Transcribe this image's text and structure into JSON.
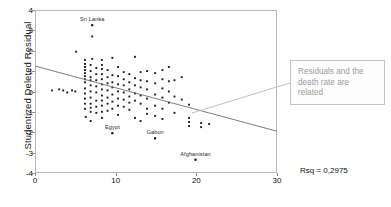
{
  "chart_data": {
    "type": "scatter",
    "title": "",
    "xlabel": "",
    "ylabel": "Studentized Deleted Residual",
    "xlim": [
      0,
      30
    ],
    "ylim": [
      -4,
      4
    ],
    "xticks": [
      "0",
      "10",
      "20",
      "30"
    ],
    "xtick_values": [
      0,
      10,
      20,
      30
    ],
    "yticks": [
      "4",
      "3",
      "2",
      "1",
      "0",
      "-1",
      "-2",
      "-3",
      "-4"
    ],
    "ytick_values": [
      4,
      3,
      2,
      1,
      0,
      -1,
      -2,
      -3,
      -4
    ],
    "grid": false,
    "legend": "none",
    "annotations": [
      {
        "text": "Rsq = 0.2975",
        "kind": "statistic"
      }
    ],
    "fit_line": {
      "name": "linear regression",
      "x": [
        0,
        30
      ],
      "y": [
        1.25,
        -1.95
      ],
      "rsq": 0.2975
    },
    "point_labels": [
      {
        "label": "Sri Lanka",
        "x": 7.1,
        "y": 3.25
      },
      {
        "label": "Egypt",
        "x": 9.6,
        "y": -2.05
      },
      {
        "label": "Gabon",
        "x": 14.9,
        "y": -2.3
      },
      {
        "label": "Afghanistan",
        "x": 19.9,
        "y": -3.35
      }
    ],
    "points": [
      [
        2.1,
        0.05
      ],
      [
        3.5,
        0.05
      ],
      [
        4.6,
        0.05
      ],
      [
        5.1,
        1.95
      ],
      [
        6.2,
        1.55
      ],
      [
        6.2,
        1.35
      ],
      [
        6.2,
        1.2
      ],
      [
        6.2,
        1.05
      ],
      [
        6.2,
        0.9
      ],
      [
        6.2,
        0.75
      ],
      [
        6.2,
        0.6
      ],
      [
        6.2,
        0.45
      ],
      [
        6.2,
        0.15
      ],
      [
        6.2,
        -0.1
      ],
      [
        6.2,
        -0.35
      ],
      [
        6.2,
        -0.6
      ],
      [
        6.2,
        -0.85
      ],
      [
        6.3,
        -1.25
      ],
      [
        6.9,
        1.3
      ],
      [
        6.9,
        1.0
      ],
      [
        6.9,
        0.7
      ],
      [
        6.9,
        0.55
      ],
      [
        6.9,
        0.3
      ],
      [
        6.9,
        0.0
      ],
      [
        6.9,
        -0.3
      ],
      [
        6.9,
        -0.6
      ],
      [
        6.9,
        -0.8
      ],
      [
        6.9,
        -1.0
      ],
      [
        6.9,
        -1.45
      ],
      [
        7.1,
        3.25
      ],
      [
        7.1,
        2.7
      ],
      [
        7.1,
        1.6
      ],
      [
        7.6,
        1.15
      ],
      [
        7.6,
        0.85
      ],
      [
        7.6,
        0.55
      ],
      [
        7.6,
        0.25
      ],
      [
        7.6,
        -0.05
      ],
      [
        7.6,
        -0.45
      ],
      [
        7.6,
        -0.75
      ],
      [
        7.6,
        -1.05
      ],
      [
        8.3,
        1.55
      ],
      [
        8.3,
        1.3
      ],
      [
        8.3,
        1.1
      ],
      [
        8.3,
        0.85
      ],
      [
        8.3,
        0.6
      ],
      [
        8.3,
        0.35
      ],
      [
        8.3,
        0.1
      ],
      [
        8.3,
        -0.2
      ],
      [
        8.3,
        -0.45
      ],
      [
        8.3,
        -0.7
      ],
      [
        8.3,
        -1.0
      ],
      [
        8.3,
        -1.3
      ],
      [
        9.0,
        1.05
      ],
      [
        9.0,
        0.7
      ],
      [
        9.0,
        0.4
      ],
      [
        9.0,
        0.05
      ],
      [
        9.0,
        -0.3
      ],
      [
        9.0,
        -0.6
      ],
      [
        9.0,
        -0.95
      ],
      [
        9.6,
        1.65
      ],
      [
        9.6,
        0.8
      ],
      [
        9.6,
        0.45
      ],
      [
        9.6,
        0.2
      ],
      [
        9.6,
        -0.15
      ],
      [
        9.6,
        -0.5
      ],
      [
        9.6,
        -0.85
      ],
      [
        9.6,
        -2.05
      ],
      [
        10.3,
        1.2
      ],
      [
        10.3,
        0.75
      ],
      [
        10.3,
        0.35
      ],
      [
        10.3,
        0.0
      ],
      [
        10.3,
        -0.35
      ],
      [
        10.3,
        -0.7
      ],
      [
        10.3,
        -1.15
      ],
      [
        11.0,
        0.95
      ],
      [
        11.0,
        0.6
      ],
      [
        11.0,
        0.3
      ],
      [
        11.0,
        -0.05
      ],
      [
        11.0,
        -0.4
      ],
      [
        11.0,
        -0.75
      ],
      [
        11.7,
        0.85
      ],
      [
        11.7,
        0.45
      ],
      [
        11.7,
        0.1
      ],
      [
        11.7,
        -0.25
      ],
      [
        11.7,
        -0.55
      ],
      [
        11.7,
        -0.9
      ],
      [
        12.4,
        1.7
      ],
      [
        12.4,
        0.65
      ],
      [
        12.4,
        0.3
      ],
      [
        12.4,
        -0.1
      ],
      [
        12.4,
        -0.45
      ],
      [
        12.4,
        -1.3
      ],
      [
        13.1,
        0.95
      ],
      [
        13.1,
        0.55
      ],
      [
        13.1,
        0.2
      ],
      [
        13.1,
        -0.2
      ],
      [
        13.1,
        -0.6
      ],
      [
        13.1,
        -1.45
      ],
      [
        13.9,
        1.0
      ],
      [
        13.9,
        0.5
      ],
      [
        13.9,
        0.1
      ],
      [
        13.9,
        -0.35
      ],
      [
        13.9,
        -0.85
      ],
      [
        13.9,
        -1.1
      ],
      [
        14.9,
        0.9
      ],
      [
        14.9,
        0.4
      ],
      [
        14.9,
        -0.15
      ],
      [
        14.9,
        -0.7
      ],
      [
        14.9,
        -1.2
      ],
      [
        14.9,
        -2.3
      ],
      [
        15.8,
        1.05
      ],
      [
        15.8,
        0.6
      ],
      [
        15.8,
        0.15
      ],
      [
        15.8,
        -0.3
      ],
      [
        15.8,
        -0.85
      ],
      [
        15.8,
        -1.35
      ],
      [
        16.6,
        1.2
      ],
      [
        16.6,
        0.5
      ],
      [
        16.6,
        0.0
      ],
      [
        16.6,
        -0.55
      ],
      [
        17.3,
        0.55
      ],
      [
        17.3,
        -0.25
      ],
      [
        17.3,
        -1.05
      ],
      [
        18.2,
        0.7
      ],
      [
        18.2,
        -0.4
      ],
      [
        19.1,
        -0.65
      ],
      [
        19.1,
        -1.3
      ],
      [
        19.1,
        -1.5
      ],
      [
        19.1,
        -1.7
      ],
      [
        19.9,
        -3.35
      ],
      [
        20.6,
        -1.55
      ],
      [
        20.6,
        -1.75
      ],
      [
        21.6,
        -1.6
      ],
      [
        4.0,
        -0.05
      ],
      [
        5.0,
        0.0
      ],
      [
        3.0,
        0.1
      ]
    ]
  },
  "callout": {
    "text": "Residuals and the\ndeath rate are\nrelated"
  },
  "rsq_label": "Rsq = 0,2975"
}
